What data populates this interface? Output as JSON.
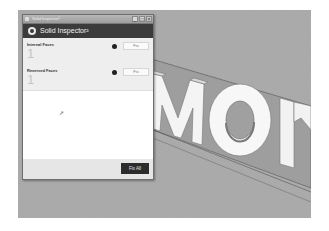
{
  "window": {
    "titlebar_text": "Solid Inspector²",
    "controls": [
      "_",
      "□",
      "×"
    ],
    "header_title": "Solid Inspector²",
    "icon": "solid-inspector-logo-icon"
  },
  "sections": [
    {
      "label": "Internal Faces",
      "count": "1",
      "status": "error",
      "fix_label": "Fix"
    },
    {
      "label": "Reversed Faces",
      "count": "1",
      "status": "error",
      "fix_label": "Fix"
    }
  ],
  "footer": {
    "fix_all_label": "Fix All"
  },
  "viewport": {
    "model_text": "MOM",
    "background": "#a9a9a9"
  },
  "colors": {
    "header": "#3b3b3b",
    "panel": "#eeeeee",
    "fix_all_bg": "#2c2c2c",
    "status_dot": "#222222"
  }
}
